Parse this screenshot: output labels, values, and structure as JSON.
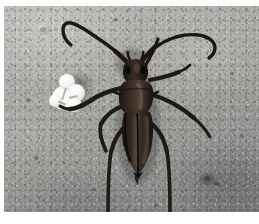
{
  "image": {
    "kind": "photograph",
    "subject": "longhorn beetle on a concrete surface",
    "orientation": "landscape",
    "width_px": 259,
    "height_px": 224,
    "border": {
      "color": "#ffffff",
      "left_px": 4,
      "top_px": 6,
      "bottom_px": 12,
      "right_px": 0
    },
    "alt_text": "A dark brown longhorn beetle with very long curved antennae rests on a gray concrete slab, a small white paper-like blob lies to its left."
  },
  "scene": {
    "background": {
      "name": "concrete-ground",
      "description": "weathered gray concrete slab with fine aggregate speckle",
      "color_light": "#b9b9b6",
      "color_mid": "#a0a09d",
      "color_dark": "#7e7e7d",
      "texture": "speckled aggregate with darker blotch lower right"
    },
    "objects": [
      {
        "name": "white-debris-blob",
        "label": "white paper-like debris",
        "color": "#ffffff",
        "shadow_color": "#4a4a48",
        "position": {
          "x": 46,
          "y": 66,
          "width": 42,
          "height": 44
        }
      },
      {
        "name": "beetle",
        "label": "longhorn beetle",
        "body_color": "#241d19",
        "highlight_color": "#5a4b42",
        "parts": [
          {
            "name": "head",
            "label": "head"
          },
          {
            "name": "pronotum",
            "label": "pronotum / thorax"
          },
          {
            "name": "elytra",
            "label": "elytra (wing covers)"
          },
          {
            "name": "antenna-left",
            "label": "left antenna, curved with hooked tip"
          },
          {
            "name": "antenna-right",
            "label": "right antenna, sweeping right with hooked tip"
          },
          {
            "name": "foreleg-left",
            "label": "left foreleg reaching toward the white blob"
          },
          {
            "name": "foreleg-right",
            "label": "right foreleg"
          },
          {
            "name": "midleg-left",
            "label": "left middle leg"
          },
          {
            "name": "midleg-right",
            "label": "right middle leg extending right"
          },
          {
            "name": "hindleg-left",
            "label": "left hind leg trailing to bottom edge"
          },
          {
            "name": "hindleg-right",
            "label": "right hind leg trailing to bottom edge"
          }
        ]
      }
    ]
  }
}
